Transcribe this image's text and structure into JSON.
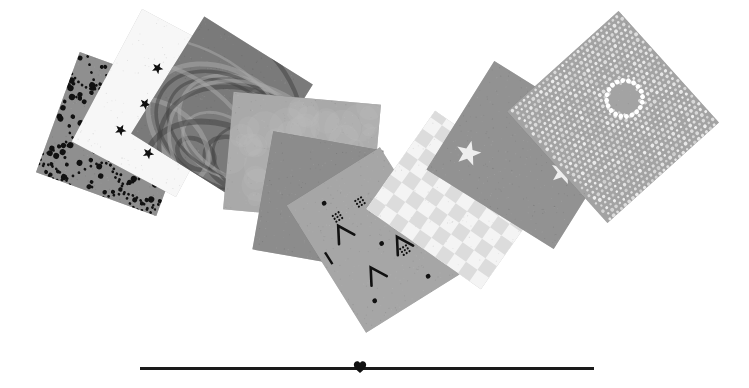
{
  "canvas": {
    "width": 749,
    "height": 388,
    "background": "#ffffff"
  },
  "swatches": [
    {
      "name": "swatch-black-dots-on-gray",
      "pattern": "dots",
      "base": "#8f8f8f",
      "ink": "#111111",
      "x": 54,
      "y": 70,
      "w": 128,
      "h": 128,
      "rotate": 20,
      "z": 1,
      "density": 140,
      "dot_min": 1.2,
      "dot_max": 3.2
    },
    {
      "name": "swatch-black-stars-on-white",
      "pattern": "stars",
      "base": "#f7f7f7",
      "ink": "#111111",
      "x": 100,
      "y": 28,
      "w": 118,
      "h": 150,
      "rotate": 28,
      "z": 2,
      "star_size": 6,
      "stars": [
        [
          0.62,
          0.12
        ],
        [
          0.35,
          0.3
        ],
        [
          0.7,
          0.32
        ],
        [
          0.4,
          0.55
        ],
        [
          0.32,
          0.78
        ],
        [
          0.62,
          0.83
        ],
        [
          0.75,
          0.6
        ]
      ]
    },
    {
      "name": "swatch-marbled-swirl",
      "pattern": "marble",
      "base": "#7a7a7a",
      "ink": "#444444",
      "x": 158,
      "y": 40,
      "w": 128,
      "h": 138,
      "rotate": 32,
      "z": 3
    },
    {
      "name": "swatch-mottled-light-gray",
      "pattern": "mottled",
      "base": "#a9a9a9",
      "ink": "#bdbdbd",
      "x": 228,
      "y": 98,
      "w": 148,
      "h": 118,
      "rotate": 5,
      "z": 4
    },
    {
      "name": "swatch-solid-medium-gray",
      "pattern": "solid",
      "base": "#8c8c8c",
      "ink": "#8c8c8c",
      "x": 262,
      "y": 140,
      "w": 112,
      "h": 120,
      "rotate": 10,
      "z": 5
    },
    {
      "name": "swatch-abstract-marks-on-gray",
      "pattern": "marks",
      "base": "#a6a6a6",
      "ink": "#111111",
      "x": 318,
      "y": 165,
      "w": 110,
      "h": 150,
      "rotate": -32,
      "z": 6
    },
    {
      "name": "swatch-pale-checkerboard",
      "pattern": "checker",
      "base": "#f4f4f4",
      "ink": "#dcdcdc",
      "x": 398,
      "y": 130,
      "w": 120,
      "h": 140,
      "rotate": -55,
      "z": 7,
      "cell": 14
    },
    {
      "name": "swatch-white-stars-on-gray",
      "pattern": "stars",
      "base": "#929292",
      "ink": "#eeeeee",
      "x": 460,
      "y": 80,
      "w": 128,
      "h": 150,
      "rotate": -58,
      "z": 8,
      "star_size": 13,
      "stars": [
        [
          0.28,
          0.18
        ],
        [
          0.55,
          0.78
        ]
      ]
    },
    {
      "name": "swatch-white-dot-mosaic-circle",
      "pattern": "mosaic",
      "base": "#a3a3a3",
      "ink": "#f2f2f2",
      "x": 538,
      "y": 42,
      "w": 150,
      "h": 150,
      "rotate": -42,
      "z": 9,
      "circle": {
        "cx": 0.64,
        "cy": 0.46,
        "r": 0.12
      }
    }
  ],
  "divider": {
    "x": 140,
    "y": 367,
    "w": 454,
    "thickness": 3,
    "color": "#1a1a1a",
    "ornament": {
      "name": "heart-icon",
      "x": 360,
      "color": "#111111"
    }
  }
}
